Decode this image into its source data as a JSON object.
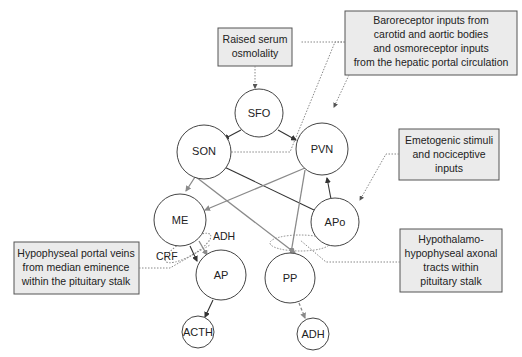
{
  "diagram": {
    "nodes": [
      {
        "id": "SFO",
        "label": "SFO"
      },
      {
        "id": "SON",
        "label": "SON"
      },
      {
        "id": "PVN",
        "label": "PVN"
      },
      {
        "id": "ME",
        "label": "ME"
      },
      {
        "id": "APo",
        "label": "APo"
      },
      {
        "id": "AP",
        "label": "AP"
      },
      {
        "id": "PP",
        "label": "PP"
      },
      {
        "id": "ACTH",
        "label": "ACTH"
      },
      {
        "id": "ADH_out",
        "label": "ADH"
      }
    ],
    "boxes": {
      "serum": {
        "lines": [
          "Raised serum",
          "osmolality"
        ]
      },
      "baro": {
        "lines": [
          "Baroreceptor inputs from",
          "carotid and aortic bodies",
          "and osmoreceptor inputs",
          "from the hepatic portal circulation"
        ]
      },
      "emeto": {
        "lines": [
          "Emetogenic stimuli",
          "and nociceptive",
          "inputs"
        ]
      },
      "portal": {
        "lines": [
          "Hypophyseal portal veins",
          "from median eminence",
          "within the pituitary stalk"
        ]
      },
      "tracts": {
        "lines": [
          "Hypothalamo-",
          "hypophyseal axonal",
          "tracts within",
          "pituitary stalk"
        ]
      }
    },
    "labels": {
      "adh": "ADH",
      "crf": "CRF"
    },
    "edges": [
      {
        "from": "SFO",
        "to": "SON",
        "style": "dark"
      },
      {
        "from": "SFO",
        "to": "PVN",
        "style": "dark"
      },
      {
        "from": "APo",
        "to": "PVN",
        "style": "dark"
      },
      {
        "from": "APo",
        "to": "SON",
        "style": "dark"
      },
      {
        "from": "SON",
        "to": "ME",
        "style": "gray"
      },
      {
        "from": "SON",
        "to": "PP",
        "style": "gray"
      },
      {
        "from": "PVN",
        "to": "ME",
        "style": "gray"
      },
      {
        "from": "PVN",
        "to": "PP",
        "style": "gray"
      },
      {
        "from": "ME",
        "to": "AP",
        "style": "dark",
        "label": "CRF"
      },
      {
        "from": "ME",
        "to": "AP",
        "style": "gray",
        "label": "ADH"
      },
      {
        "from": "AP",
        "to": "ACTH",
        "style": "dark"
      },
      {
        "from": "PP",
        "to": "ADH",
        "style": "gray-dashed"
      }
    ],
    "colors": {
      "box_fill": "#ebebeb",
      "box_stroke": "#555555",
      "node_stroke": "#444444",
      "dark_arrow": "#333333",
      "gray_arrow": "#8a8a8a",
      "dotted": "#888888"
    }
  }
}
